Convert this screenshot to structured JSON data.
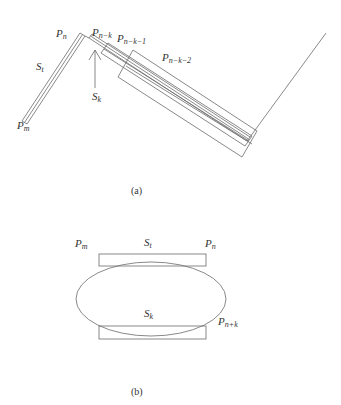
{
  "figure_a": {
    "caption": "(a)",
    "labels": {
      "p_n": {
        "base": "P",
        "sub": "n"
      },
      "p_nk": {
        "base": "P",
        "sub": "n−k"
      },
      "p_nk1": {
        "base": "P",
        "sub": "n−k−1"
      },
      "p_nk2": {
        "base": "P",
        "sub": "n−k−2"
      },
      "s_t": {
        "base": "S",
        "sub": "t"
      },
      "s_k": {
        "base": "S",
        "sub": "k"
      },
      "p_m": {
        "base": "P",
        "sub": "m"
      }
    }
  },
  "figure_b": {
    "caption": "(b)",
    "labels": {
      "p_m": {
        "base": "P",
        "sub": "m"
      },
      "s_t": {
        "base": "S",
        "sub": "t"
      },
      "p_n": {
        "base": "P",
        "sub": "n"
      },
      "s_k": {
        "base": "S",
        "sub": "k"
      },
      "p_nk": {
        "base": "P",
        "sub": "n+k"
      }
    }
  },
  "colors": {
    "stroke": "#6b6b6b",
    "text": "#333333",
    "background": "#ffffff"
  }
}
